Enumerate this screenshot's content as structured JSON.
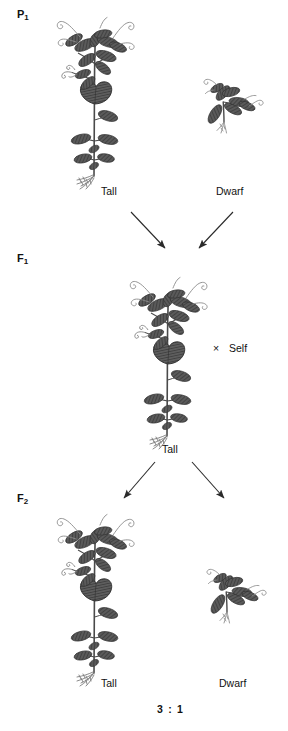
{
  "figure": {
    "background_color": "#ffffff",
    "ink_color": "#4a4a4a",
    "text_color": "#111111"
  },
  "generations": [
    {
      "id": "p1",
      "label": "P",
      "subscript": "1"
    },
    {
      "id": "f1",
      "label": "F",
      "subscript": "1"
    },
    {
      "id": "f2",
      "label": "F",
      "subscript": "2"
    }
  ],
  "p1": {
    "generation_label": "P",
    "generation_subscript": "1",
    "left_plant": {
      "type": "tall-pea-plant",
      "label": "Tall"
    },
    "right_plant": {
      "type": "dwarf-pea-plant",
      "label": "Dwarf"
    }
  },
  "f1": {
    "generation_label": "F",
    "generation_subscript": "1",
    "plant": {
      "type": "tall-pea-plant",
      "label": "Tall"
    },
    "self_cross_symbol": "×",
    "self_cross_text": "Self"
  },
  "f2": {
    "generation_label": "F",
    "generation_subscript": "2",
    "left_plant": {
      "type": "tall-pea-plant",
      "label": "Tall"
    },
    "right_plant": {
      "type": "dwarf-pea-plant",
      "label": "Dwarf"
    },
    "ratio": "3 : 1"
  },
  "arrows": {
    "p1_to_f1_left": "arrow-down-right",
    "p1_to_f1_right": "arrow-down-left",
    "f1_to_f2_left": "arrow-down-left",
    "f1_to_f2_right": "arrow-down-right"
  }
}
